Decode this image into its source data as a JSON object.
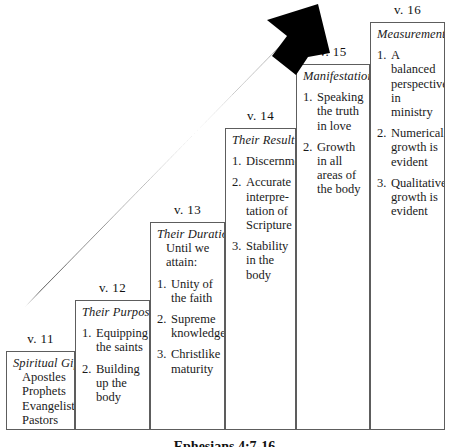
{
  "diagram": {
    "title_caption": "Ephesians 4:7-16 ",
    "arrow": {
      "name": "upward-growth-arrow",
      "color": "#000000",
      "from": [
        28,
        302
      ],
      "to": [
        317,
        6
      ]
    },
    "columns": [
      {
        "verse": "v. 11",
        "heading": "Spiritual Gifts",
        "plain_lines": [
          "Apostles",
          "Prophets",
          "Evangelists",
          "Pastors",
          "Teachers"
        ],
        "items": []
      },
      {
        "verse": "v. 12",
        "heading": "Their Purpose",
        "plain_lines": [],
        "items": [
          {
            "num": "1.",
            "text": "Equipping the saints"
          },
          {
            "num": "2.",
            "text": "Building up the body"
          }
        ]
      },
      {
        "verse": "v. 13",
        "heading": "Their Duration",
        "plain_lines": [
          "Until we",
          "attain:"
        ],
        "items": [
          {
            "num": "1.",
            "text": "Unity of the faith"
          },
          {
            "num": "2.",
            "text": "Supreme knowledge"
          },
          {
            "num": "3.",
            "text": "Christlike maturity"
          }
        ]
      },
      {
        "verse": "v. 14",
        "heading": "Their Result",
        "plain_lines": [],
        "items": [
          {
            "num": "1.",
            "text": "Discernment"
          },
          {
            "num": "2.",
            "text": "Accurate interpre-tation of Scripture"
          },
          {
            "num": "3.",
            "text": "Stability in the body"
          }
        ]
      },
      {
        "verse": "v. 15",
        "heading": "Manifestations",
        "plain_lines": [],
        "items": [
          {
            "num": "1.",
            "text": "Speaking the truth in love"
          },
          {
            "num": "2.",
            "text": "Growth in all areas of the body"
          }
        ]
      },
      {
        "verse": "v. 16",
        "heading": "Measurements",
        "plain_lines": [],
        "items": [
          {
            "num": "1.",
            "text": "A balanced perspective in ministry"
          },
          {
            "num": "2.",
            "text": "Numerical growth is evident"
          },
          {
            "num": "3.",
            "text": "Qualitative growth is evident"
          }
        ]
      }
    ]
  }
}
